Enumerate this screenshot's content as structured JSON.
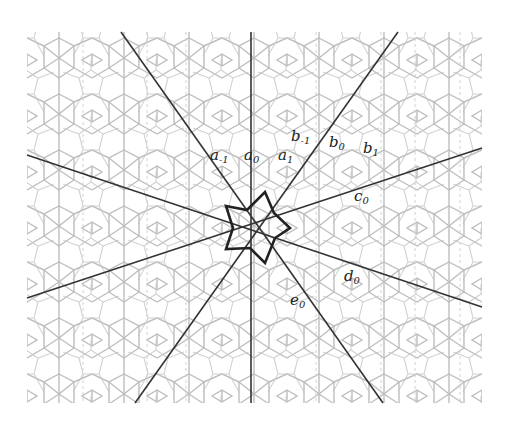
{
  "figure": {
    "background": "#ffffff",
    "tiling": {
      "description": "quasi-periodic rosette tiling (light gray)",
      "color": "#b8b8b8",
      "region": {
        "x": 27,
        "y": 32,
        "width": 455,
        "height": 371
      }
    },
    "center": {
      "x": 252,
      "y": 228
    },
    "line_color": "#333333",
    "lines": [
      {
        "id": "a0",
        "x1": 251,
        "y1": 32,
        "x2": 251,
        "y2": 403
      },
      {
        "id": "a-1/e0",
        "x1": 121,
        "y1": 32,
        "x2": 383,
        "y2": 403
      },
      {
        "id": "b0",
        "x1": 398,
        "y1": 32,
        "x2": 135,
        "y2": 403
      },
      {
        "id": "d0",
        "x1": 27,
        "y1": 155,
        "x2": 482,
        "y2": 307
      },
      {
        "id": "c0",
        "x1": 482,
        "y1": 148,
        "x2": 27,
        "y2": 298
      }
    ],
    "star": {
      "stroke": "#222222",
      "points": "226,206 247,210 265,192 274,213 290,228 275,238 265,263 250,248 226,249 233,228"
    },
    "labels": [
      {
        "base": "a",
        "sub": "-1",
        "x": 210,
        "y": 160
      },
      {
        "base": "a",
        "sub": "0",
        "x": 244,
        "y": 160
      },
      {
        "base": "a",
        "sub": "1",
        "x": 278,
        "y": 160
      },
      {
        "base": "b",
        "sub": "-1",
        "x": 291,
        "y": 141
      },
      {
        "base": "b",
        "sub": "0",
        "x": 329,
        "y": 147
      },
      {
        "base": "b",
        "sub": "1",
        "x": 363,
        "y": 153
      },
      {
        "base": "c",
        "sub": "0",
        "x": 354,
        "y": 201
      },
      {
        "base": "d",
        "sub": "0",
        "x": 344,
        "y": 281
      },
      {
        "base": "e",
        "sub": "0",
        "x": 290,
        "y": 305
      }
    ]
  }
}
